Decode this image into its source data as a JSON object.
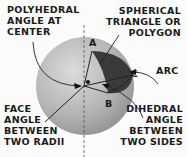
{
  "labels": {
    "polyhedral": [
      "POLYHEDRAL",
      "ANGLE AT",
      "CENTER"
    ],
    "spherical": [
      "SPHERICAL",
      "TRIANGLE OR",
      "POLYGON"
    ],
    "arc": "ARC",
    "face": [
      "FACE",
      "ANGLE",
      "BETWEEN",
      "TWO RADII"
    ],
    "dihedral": [
      "DIHEDRAL",
      "ANGLE",
      "BETWEEN",
      "TWO SIDES"
    ]
  },
  "points": {
    "a": "A",
    "b": "B",
    "c": "C"
  },
  "colors": {
    "sphere_light": "#d6d6d6",
    "sphere_dark": "#8a8a8a",
    "triangle": "#3c3c3c",
    "ink": "#1a1a1a"
  }
}
